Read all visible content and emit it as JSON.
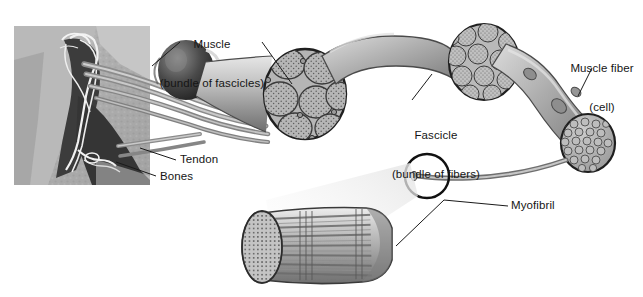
{
  "figure": {
    "title_visible": false,
    "background_color": "#ffffff",
    "ink_color": "#151515"
  },
  "labels": {
    "muscle": {
      "line1": "Muscle",
      "line2": "(bundle of fascicles)"
    },
    "fascicle": {
      "line1": "Fascicle",
      "line2": "(bundle of fibers)"
    },
    "muscle_fiber": {
      "line1": "Muscle fiber",
      "line2": "(cell)"
    },
    "tendon": {
      "text": "Tendon"
    },
    "bones": {
      "text": "Bones"
    },
    "myofibril": {
      "text": "Myofibril"
    }
  },
  "parts": {
    "photo": {
      "name": "arm-photograph",
      "tone": "grayscale"
    },
    "muscle_belly": {
      "name": "muscle-belly"
    },
    "muscle_cross_section": {
      "name": "muscle-cross-section",
      "fascicle_count": 7
    },
    "fascicle_cross_section": {
      "name": "fascicle-cross-section",
      "fiber_count": 19
    },
    "fiber_tube": {
      "name": "muscle-fiber-tube",
      "nuclei_count": 3
    },
    "fiber_cross_section": {
      "name": "muscle-fiber-cut-end"
    },
    "magnifier": {
      "name": "magnification-circle"
    },
    "myofibril_cylinder": {
      "name": "myofibril-cylinder",
      "striated": true
    }
  },
  "palette": {
    "tissue_light": "#cfcfcf",
    "tissue_mid": "#a9a9a9",
    "tissue_dark": "#7d7d7d",
    "outline": "#2b2b2b",
    "stipple": "#6f6f6f",
    "photo_dark": "#3a3a3a",
    "photo_light": "#d9d9d9"
  }
}
